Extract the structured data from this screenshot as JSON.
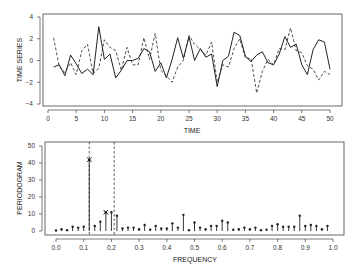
{
  "chart_data": [
    {
      "type": "line",
      "title": "",
      "xlabel": "TIME",
      "ylabel": "TIME SERIES",
      "xlim": [
        0,
        50
      ],
      "ylim": [
        -4,
        4
      ],
      "xticks": [
        "0",
        "5",
        "10",
        "15",
        "20",
        "25",
        "30",
        "35",
        "40",
        "45",
        "50"
      ],
      "yticks": [
        "-4",
        "-2",
        "0",
        "2",
        "4"
      ],
      "grid": false,
      "legend": null,
      "x": [
        1,
        2,
        3,
        4,
        5,
        6,
        7,
        8,
        9,
        10,
        11,
        12,
        13,
        14,
        15,
        16,
        17,
        18,
        19,
        20,
        21,
        22,
        23,
        24,
        25,
        26,
        27,
        28,
        29,
        30,
        31,
        32,
        33,
        34,
        35,
        36,
        37,
        38,
        39,
        40,
        41,
        42,
        43,
        44,
        45,
        46,
        47,
        48,
        49,
        50
      ],
      "series": [
        {
          "name": "observed",
          "style": "solid",
          "values": [
            -0.6,
            -0.4,
            -1.4,
            0.5,
            -0.3,
            -1.2,
            -0.8,
            -1.3,
            3.1,
            0.1,
            0.6,
            -1.6,
            -0.9,
            0.0,
            0.0,
            0.2,
            1.1,
            0.8,
            -1.0,
            -0.2,
            -1.6,
            0.1,
            2.1,
            0.2,
            2.2,
            0.0,
            1.1,
            0.3,
            0.6,
            -2.4,
            0.0,
            0.4,
            2.6,
            2.3,
            0.4,
            -0.1,
            0.5,
            0.8,
            -0.2,
            -0.4,
            0.6,
            2.2,
            1.2,
            1.5,
            -0.4,
            -1.3,
            1.0,
            1.9,
            1.7,
            -0.8
          ]
        },
        {
          "name": "fitted",
          "style": "dashed",
          "values": [
            2.1,
            -0.6,
            -1.1,
            -0.2,
            -1.3,
            0.9,
            1.5,
            -1.2,
            -0.7,
            1.9,
            1.2,
            0.9,
            -0.9,
            1.2,
            -0.4,
            -0.4,
            2.1,
            0.1,
            2.5,
            -0.9,
            -1.4,
            -2.0,
            -0.6,
            0.0,
            2.3,
            1.5,
            1.0,
            0.5,
            1.7,
            -2.0,
            -0.4,
            -0.6,
            1.1,
            2.0,
            0.2,
            0.2,
            -3.0,
            -1.0,
            0.1,
            -0.4,
            1.1,
            1.0,
            3.0,
            0.9,
            0.7,
            -0.5,
            -0.8,
            -1.8,
            -1.0,
            -1.3
          ]
        }
      ]
    },
    {
      "type": "bar",
      "subtype": "stem",
      "title": "",
      "xlabel": "FREQUENCY",
      "ylabel": "PERIODOGRAM",
      "xlim": [
        0.0,
        1.0
      ],
      "ylim": [
        0,
        50
      ],
      "xticks": [
        "0.0",
        "0.1",
        "0.2",
        "0.3",
        "0.4",
        "0.5",
        "0.6",
        "0.7",
        "0.8",
        "0.9",
        "1.0"
      ],
      "yticks": [
        "0",
        "10",
        "20",
        "30",
        "40",
        "50"
      ],
      "grid": false,
      "legend": null,
      "categories": [
        0.0,
        0.02,
        0.04,
        0.06,
        0.08,
        0.1,
        0.12,
        0.14,
        0.16,
        0.18,
        0.2,
        0.22,
        0.24,
        0.26,
        0.28,
        0.3,
        0.32,
        0.34,
        0.36,
        0.38,
        0.4,
        0.42,
        0.44,
        0.46,
        0.48,
        0.5,
        0.52,
        0.54,
        0.56,
        0.58,
        0.6,
        0.62,
        0.64,
        0.66,
        0.68,
        0.7,
        0.72,
        0.74,
        0.76,
        0.78,
        0.8,
        0.82,
        0.84,
        0.86,
        0.88,
        0.9,
        0.92,
        0.94,
        0.96,
        0.98
      ],
      "values": [
        0.3,
        1,
        0.5,
        2.5,
        2,
        2.5,
        42,
        3,
        5.5,
        11,
        11,
        9,
        1.5,
        2,
        2,
        1,
        3.5,
        0.8,
        3,
        1.5,
        1.5,
        4.5,
        2,
        9.5,
        0.5,
        5,
        2,
        1,
        3,
        3,
        6,
        5,
        0.8,
        1,
        2,
        1,
        2,
        0.5,
        0.8,
        3,
        4,
        2.5,
        2.5,
        2.5,
        9,
        3,
        3.5,
        3,
        1,
        3
      ],
      "annotations": [
        {
          "type": "x-marker",
          "x": 0.12,
          "y": 42
        },
        {
          "type": "x-marker",
          "x": 0.18,
          "y": 11
        },
        {
          "type": "dashed-vline",
          "x": 0.12
        },
        {
          "type": "dashed-vline",
          "x": 0.21
        }
      ]
    }
  ],
  "colors": {
    "line": "#222222",
    "axis": "#444444"
  }
}
